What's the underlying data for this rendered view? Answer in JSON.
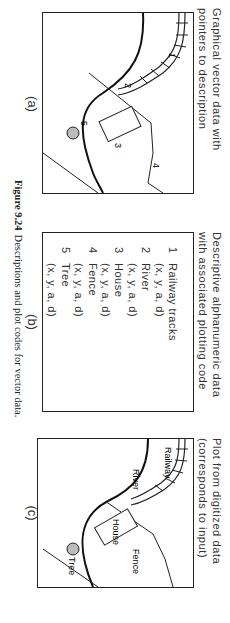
{
  "figure": {
    "caption_number": "Figure 9.24",
    "caption_text": "Descriptions and plot codes for vector data."
  },
  "panels": {
    "a": {
      "title_line1": "Graphical vector data with",
      "title_line2": "pointers to description",
      "label": "(a)",
      "pointers": [
        "1",
        "2",
        "3",
        "4",
        "5"
      ]
    },
    "b": {
      "title_line1": "Descriptive alphanumeric data",
      "title_line2": "with associated plotting code",
      "label": "(b)",
      "items": [
        {
          "num": "1",
          "name": "Railway tracks",
          "attrs": "(x, y, a, d)"
        },
        {
          "num": "2",
          "name": "River",
          "attrs": "(x, y, a, d)"
        },
        {
          "num": "3",
          "name": "House",
          "attrs": "(x, y, a, d)"
        },
        {
          "num": "4",
          "name": "Fence",
          "attrs": "(x, y, a, d)"
        },
        {
          "num": "5",
          "name": "Tree",
          "attrs": "(x, y, a, d)"
        }
      ]
    },
    "c": {
      "title_line1": "Plot from digitized data",
      "title_line2": "(corresponds to input)",
      "label": "(c)",
      "feature_labels": {
        "railway": "Railway",
        "river": "River",
        "house": "House",
        "fence": "Fence",
        "tree": "Tree"
      }
    }
  }
}
